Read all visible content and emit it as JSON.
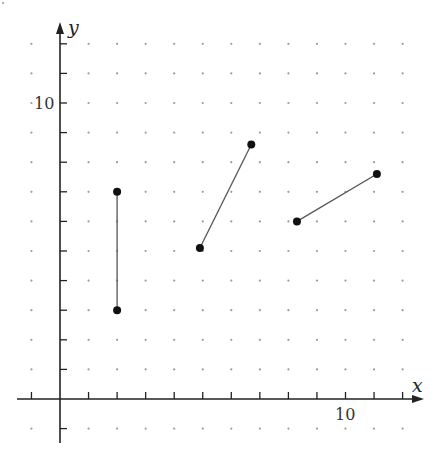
{
  "figure": {
    "x_axis_label": "x",
    "y_axis_label": "y",
    "x_tick_label": "10",
    "y_tick_label": "10",
    "colors": {
      "axis": "#222222",
      "grid_dot": "#9a9a9a",
      "segment": "#555555",
      "endpoint": "#111111",
      "background": "#ffffff"
    }
  },
  "chart_data": {
    "type": "scatter",
    "title": "",
    "xlabel": "x",
    "ylabel": "y",
    "xlim": [
      -1,
      12
    ],
    "ylim": [
      -1,
      12
    ],
    "grid": "dot grid at integer coordinates",
    "x_ticks_labeled": [
      10
    ],
    "y_ticks_labeled": [
      10
    ],
    "segments": [
      {
        "name": "segment-1",
        "start": [
          2,
          3
        ],
        "end": [
          2,
          7
        ]
      },
      {
        "name": "segment-2",
        "start": [
          4.9,
          5.1
        ],
        "end": [
          6.7,
          8.6
        ]
      },
      {
        "name": "segment-3",
        "start": [
          8.3,
          6.0
        ],
        "end": [
          11.1,
          7.6
        ]
      }
    ]
  }
}
